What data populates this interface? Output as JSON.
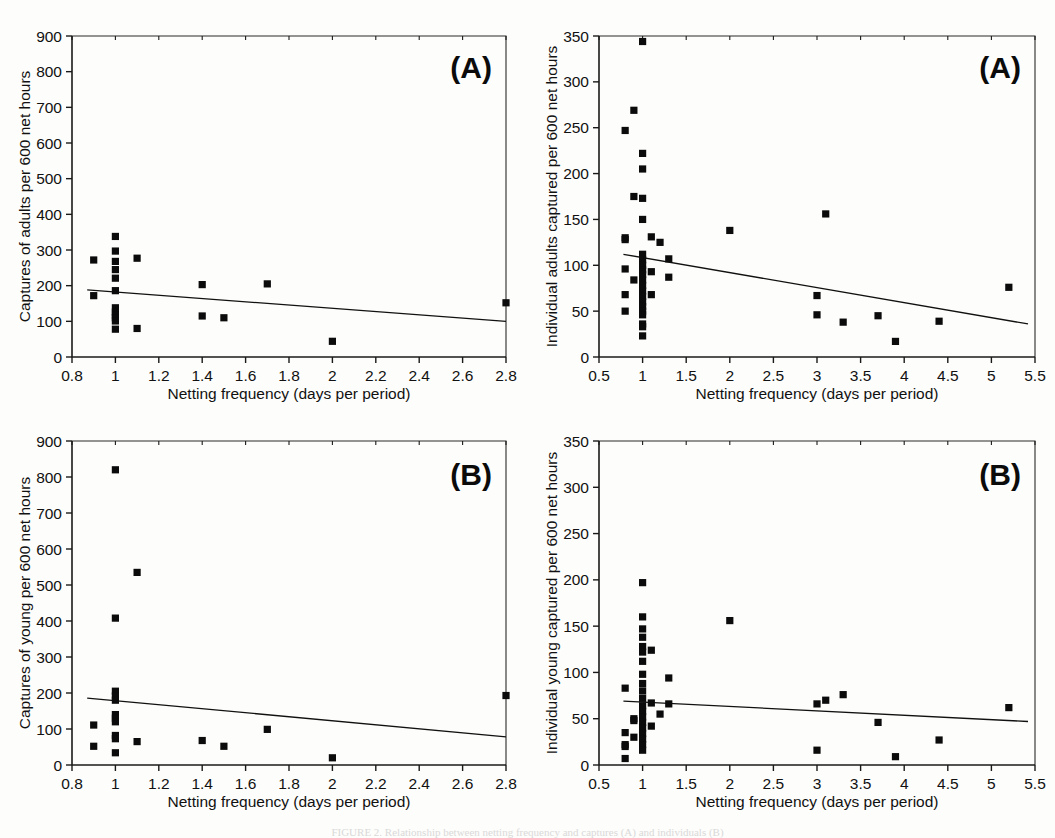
{
  "figure": {
    "background_color": "#fdfdfb",
    "marker_color": "#0b0b0b",
    "line_color": "#111111",
    "shared_xlabel": "Netting frequency (days per period)",
    "caption_partial": "FIGURE 2. Relationship between netting frequency and captures (A) and individuals (B)"
  },
  "chart_data": [
    {
      "id": "panel-top-left",
      "type": "scatter",
      "tag": "(A)",
      "title": "",
      "xlabel": "Netting frequency (days per period)",
      "ylabel": "Captures of adults per 600 net hours",
      "xlim": [
        0.8,
        2.8
      ],
      "ylim": [
        0,
        900
      ],
      "xticks": [
        0.8,
        1,
        1.2,
        1.4,
        1.6,
        1.8,
        2,
        2.2,
        2.4,
        2.6,
        2.8
      ],
      "xticklabels": [
        "0.8",
        "1",
        "1.2",
        "1.4",
        "1.6",
        "1.8",
        "2",
        "2.2",
        "2.4",
        "2.6",
        "2.8"
      ],
      "yticks": [
        0,
        100,
        200,
        300,
        400,
        500,
        600,
        700,
        800,
        900
      ],
      "yticklabels": [
        "0",
        "100",
        "200",
        "300",
        "400",
        "500",
        "600",
        "700",
        "800",
        "900"
      ],
      "grid": false,
      "legend": "none",
      "points": [
        [
          0.9,
          272
        ],
        [
          0.9,
          172
        ],
        [
          1.0,
          338
        ],
        [
          1.0,
          297
        ],
        [
          1.0,
          268
        ],
        [
          1.0,
          245
        ],
        [
          1.0,
          221
        ],
        [
          1.0,
          186
        ],
        [
          1.0,
          138
        ],
        [
          1.0,
          126
        ],
        [
          1.0,
          118
        ],
        [
          1.0,
          110
        ],
        [
          1.0,
          101
        ],
        [
          1.0,
          78
        ],
        [
          1.1,
          277
        ],
        [
          1.1,
          80
        ],
        [
          1.4,
          203
        ],
        [
          1.4,
          115
        ],
        [
          1.5,
          110
        ],
        [
          1.7,
          205
        ],
        [
          2.0,
          44
        ],
        [
          2.8,
          152
        ]
      ],
      "trendline": {
        "x": [
          0.87,
          2.8
        ],
        "y": [
          188,
          100
        ]
      }
    },
    {
      "id": "panel-top-right",
      "type": "scatter",
      "tag": "(A)",
      "title": "",
      "xlabel": "Netting frequency (days per period)",
      "ylabel": "Individual adults captured per 600 net hours",
      "xlim": [
        0.5,
        5.5
      ],
      "ylim": [
        0,
        350
      ],
      "xticks": [
        0.5,
        1,
        1.5,
        2,
        2.5,
        3,
        3.5,
        4,
        4.5,
        5,
        5.5
      ],
      "xticklabels": [
        "0.5",
        "1",
        "1.5",
        "2",
        "2.5",
        "3",
        "3.5",
        "4",
        "4.5",
        "5",
        "5.5"
      ],
      "yticks": [
        0,
        50,
        100,
        150,
        200,
        250,
        300,
        350
      ],
      "yticklabels": [
        "0",
        "50",
        "100",
        "150",
        "200",
        "250",
        "300",
        "350"
      ],
      "grid": false,
      "legend": "none",
      "points": [
        [
          0.8,
          247
        ],
        [
          0.8,
          130
        ],
        [
          0.8,
          128
        ],
        [
          0.8,
          96
        ],
        [
          0.8,
          68
        ],
        [
          0.8,
          50
        ],
        [
          0.9,
          269
        ],
        [
          0.9,
          175
        ],
        [
          0.9,
          84
        ],
        [
          1.0,
          344
        ],
        [
          1.0,
          222
        ],
        [
          1.0,
          205
        ],
        [
          1.0,
          173
        ],
        [
          1.0,
          150
        ],
        [
          1.0,
          112
        ],
        [
          1.0,
          106
        ],
        [
          1.0,
          100
        ],
        [
          1.0,
          95
        ],
        [
          1.0,
          90
        ],
        [
          1.0,
          84
        ],
        [
          1.0,
          78
        ],
        [
          1.0,
          72
        ],
        [
          1.0,
          66
        ],
        [
          1.0,
          60
        ],
        [
          1.0,
          55
        ],
        [
          1.0,
          50
        ],
        [
          1.0,
          46
        ],
        [
          1.0,
          36
        ],
        [
          1.0,
          33
        ],
        [
          1.0,
          23
        ],
        [
          1.1,
          131
        ],
        [
          1.1,
          93
        ],
        [
          1.1,
          68
        ],
        [
          1.2,
          125
        ],
        [
          1.3,
          107
        ],
        [
          1.3,
          87
        ],
        [
          2.0,
          138
        ],
        [
          3.0,
          67
        ],
        [
          3.0,
          46
        ],
        [
          3.1,
          156
        ],
        [
          3.3,
          38
        ],
        [
          3.7,
          45
        ],
        [
          3.9,
          17
        ],
        [
          4.4,
          39
        ],
        [
          5.2,
          76
        ]
      ],
      "trendline": {
        "x": [
          0.78,
          5.42
        ],
        "y": [
          112,
          36
        ]
      }
    },
    {
      "id": "panel-bottom-left",
      "type": "scatter",
      "tag": "(B)",
      "title": "",
      "xlabel": "Netting frequency (days per period)",
      "ylabel": "Captures of young per 600 net hours",
      "xlim": [
        0.8,
        2.8
      ],
      "ylim": [
        0,
        900
      ],
      "xticks": [
        0.8,
        1,
        1.2,
        1.4,
        1.6,
        1.8,
        2,
        2.2,
        2.4,
        2.6,
        2.8
      ],
      "xticklabels": [
        "0.8",
        "1",
        "1.2",
        "1.4",
        "1.6",
        "1.8",
        "2",
        "2.2",
        "2.4",
        "2.6",
        "2.8"
      ],
      "yticks": [
        0,
        100,
        200,
        300,
        400,
        500,
        600,
        700,
        800,
        900
      ],
      "yticklabels": [
        "0",
        "100",
        "200",
        "300",
        "400",
        "500",
        "600",
        "700",
        "800",
        "900"
      ],
      "grid": false,
      "legend": "none",
      "points": [
        [
          0.9,
          111
        ],
        [
          0.9,
          52
        ],
        [
          1.0,
          820
        ],
        [
          1.0,
          408
        ],
        [
          1.0,
          205
        ],
        [
          1.0,
          192
        ],
        [
          1.0,
          180
        ],
        [
          1.0,
          140
        ],
        [
          1.0,
          130
        ],
        [
          1.0,
          120
        ],
        [
          1.0,
          82
        ],
        [
          1.0,
          73
        ],
        [
          1.0,
          34
        ],
        [
          1.1,
          535
        ],
        [
          1.1,
          65
        ],
        [
          1.4,
          68
        ],
        [
          1.5,
          52
        ],
        [
          1.7,
          99
        ],
        [
          2.0,
          20
        ],
        [
          2.8,
          193
        ]
      ],
      "trendline": {
        "x": [
          0.87,
          2.8
        ],
        "y": [
          186,
          78
        ]
      }
    },
    {
      "id": "panel-bottom-right",
      "type": "scatter",
      "tag": "(B)",
      "title": "",
      "xlabel": "Netting frequency (days per period)",
      "ylabel": "Individual young captured per 600 net hours",
      "xlim": [
        0.5,
        5.5
      ],
      "ylim": [
        0,
        350
      ],
      "xticks": [
        0.5,
        1,
        1.5,
        2,
        2.5,
        3,
        3.5,
        4,
        4.5,
        5,
        5.5
      ],
      "xticklabels": [
        "0.5",
        "1",
        "1.5",
        "2",
        "2.5",
        "3",
        "3.5",
        "4",
        "4.5",
        "5",
        "5.5"
      ],
      "yticks": [
        0,
        50,
        100,
        150,
        200,
        250,
        300,
        350
      ],
      "yticklabels": [
        "0",
        "50",
        "100",
        "150",
        "200",
        "250",
        "300",
        "350"
      ],
      "grid": false,
      "legend": "none",
      "points": [
        [
          0.8,
          83
        ],
        [
          0.8,
          35
        ],
        [
          0.8,
          22
        ],
        [
          0.8,
          20
        ],
        [
          0.8,
          7
        ],
        [
          0.9,
          50
        ],
        [
          0.9,
          48
        ],
        [
          0.9,
          30
        ],
        [
          1.0,
          197
        ],
        [
          1.0,
          160
        ],
        [
          1.0,
          147
        ],
        [
          1.0,
          138
        ],
        [
          1.0,
          128
        ],
        [
          1.0,
          122
        ],
        [
          1.0,
          112
        ],
        [
          1.0,
          98
        ],
        [
          1.0,
          88
        ],
        [
          1.0,
          80
        ],
        [
          1.0,
          72
        ],
        [
          1.0,
          64
        ],
        [
          1.0,
          58
        ],
        [
          1.0,
          52
        ],
        [
          1.0,
          46
        ],
        [
          1.0,
          40
        ],
        [
          1.0,
          34
        ],
        [
          1.0,
          28
        ],
        [
          1.0,
          22
        ],
        [
          1.0,
          16
        ],
        [
          1.1,
          124
        ],
        [
          1.1,
          67
        ],
        [
          1.1,
          42
        ],
        [
          1.2,
          55
        ],
        [
          1.3,
          94
        ],
        [
          1.3,
          66
        ],
        [
          2.0,
          156
        ],
        [
          3.0,
          66
        ],
        [
          3.0,
          16
        ],
        [
          3.1,
          70
        ],
        [
          3.3,
          76
        ],
        [
          3.7,
          46
        ],
        [
          3.9,
          9
        ],
        [
          4.4,
          27
        ],
        [
          5.2,
          62
        ]
      ],
      "trendline": {
        "x": [
          0.78,
          5.42
        ],
        "y": [
          69,
          47
        ]
      }
    }
  ]
}
